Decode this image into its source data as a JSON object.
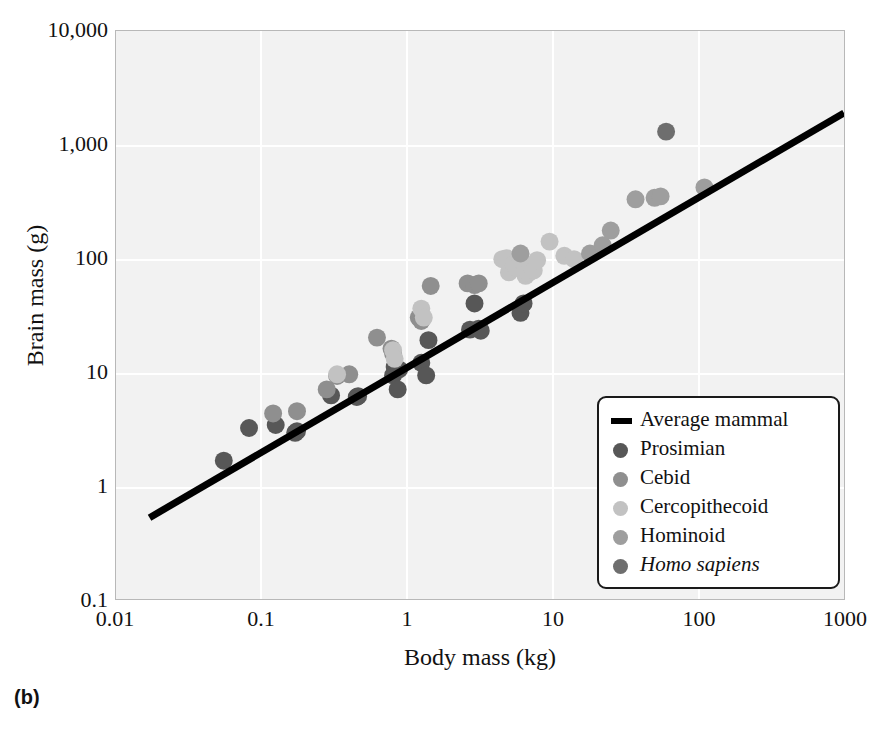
{
  "panel_caption": "(b)",
  "axes": {
    "x_title": "Body mass (kg)",
    "y_title": "Brain mass (g)",
    "x_ticks": [
      "0.01",
      "0.1",
      "1",
      "10",
      "100",
      "1000"
    ],
    "y_ticks": [
      "0.1",
      "1",
      "10",
      "100",
      "1,000",
      "10,000"
    ]
  },
  "legend": {
    "items": [
      {
        "label": "Average mammal",
        "marker": "line",
        "color": "#000000",
        "italic": false
      },
      {
        "label": "Prosimian",
        "marker": "dot",
        "color": "#575757",
        "italic": false
      },
      {
        "label": "Cebid",
        "marker": "dot",
        "color": "#8f8f8f",
        "italic": false
      },
      {
        "label": "Cercopithecoid",
        "marker": "dot",
        "color": "#c2c2c2",
        "italic": false
      },
      {
        "label": "Hominoid",
        "marker": "dot",
        "color": "#9e9e9e",
        "italic": false
      },
      {
        "label": "Homo sapiens",
        "marker": "dot",
        "color": "#6e6e6e",
        "italic": true
      }
    ]
  },
  "chart_data": {
    "type": "scatter",
    "title": "",
    "xlabel": "Body mass (kg)",
    "ylabel": "Brain mass (g)",
    "xscale": "log",
    "yscale": "log",
    "xlim": [
      0.01,
      1000
    ],
    "ylim": [
      0.1,
      10000
    ],
    "grid": true,
    "legend_position": "bottom-right",
    "marker_radius_px": 9,
    "colors": {
      "prosimian": "#575757",
      "cebid": "#8f8f8f",
      "cercopithecoid": "#c2c2c2",
      "hominoid": "#9e9e9e",
      "homo_sapiens": "#6e6e6e",
      "average_mammal_line": "#000000",
      "plot_background": "#f2f2f2",
      "gridline": "#ffffff",
      "page_background": "#ffffff"
    },
    "trendline": {
      "name": "Average mammal",
      "color": "#000000",
      "width_px": 7,
      "points": [
        {
          "x": 0.017,
          "y": 0.52
        },
        {
          "x": 1000,
          "y": 1900
        }
      ]
    },
    "series": [
      {
        "name": "Prosimian",
        "color": "#575757",
        "points": [
          {
            "x": 0.055,
            "y": 1.65
          },
          {
            "x": 0.082,
            "y": 3.2
          },
          {
            "x": 0.125,
            "y": 3.4
          },
          {
            "x": 0.17,
            "y": 2.9
          },
          {
            "x": 0.175,
            "y": 3.0
          },
          {
            "x": 0.3,
            "y": 6.2
          },
          {
            "x": 0.45,
            "y": 6.0
          },
          {
            "x": 0.46,
            "y": 6.1
          },
          {
            "x": 0.8,
            "y": 9.3
          },
          {
            "x": 0.82,
            "y": 11.0
          },
          {
            "x": 0.86,
            "y": 7.0
          },
          {
            "x": 0.88,
            "y": 10.5
          },
          {
            "x": 1.25,
            "y": 12.0
          },
          {
            "x": 1.35,
            "y": 9.3
          },
          {
            "x": 1.4,
            "y": 19.0
          },
          {
            "x": 2.7,
            "y": 23.5
          },
          {
            "x": 2.9,
            "y": 40.0
          },
          {
            "x": 3.1,
            "y": 24.0
          },
          {
            "x": 3.2,
            "y": 23.0
          },
          {
            "x": 6.0,
            "y": 33.0
          },
          {
            "x": 6.3,
            "y": 40.0
          }
        ]
      },
      {
        "name": "Cebid",
        "color": "#8f8f8f",
        "points": [
          {
            "x": 0.12,
            "y": 4.3
          },
          {
            "x": 0.175,
            "y": 4.5
          },
          {
            "x": 0.28,
            "y": 7.0
          },
          {
            "x": 0.33,
            "y": 9.2
          },
          {
            "x": 0.4,
            "y": 9.5
          },
          {
            "x": 0.62,
            "y": 20.0
          },
          {
            "x": 0.78,
            "y": 16.0
          },
          {
            "x": 0.8,
            "y": 14.5
          },
          {
            "x": 1.2,
            "y": 30.0
          },
          {
            "x": 1.25,
            "y": 28.0
          },
          {
            "x": 1.45,
            "y": 57.0
          },
          {
            "x": 2.6,
            "y": 60.0
          },
          {
            "x": 2.9,
            "y": 58.0
          },
          {
            "x": 3.1,
            "y": 60.0
          }
        ]
      },
      {
        "name": "Cercopithecoid",
        "color": "#c2c2c2",
        "points": [
          {
            "x": 0.33,
            "y": 9.5
          },
          {
            "x": 0.8,
            "y": 15.5
          },
          {
            "x": 0.82,
            "y": 13.0
          },
          {
            "x": 1.25,
            "y": 36.0
          },
          {
            "x": 1.3,
            "y": 30.0
          },
          {
            "x": 4.5,
            "y": 98.0
          },
          {
            "x": 4.8,
            "y": 100.0
          },
          {
            "x": 5.0,
            "y": 75.0
          },
          {
            "x": 5.4,
            "y": 88.0
          },
          {
            "x": 5.6,
            "y": 82.0
          },
          {
            "x": 6.0,
            "y": 96.0
          },
          {
            "x": 6.5,
            "y": 70.0
          },
          {
            "x": 6.8,
            "y": 74.0
          },
          {
            "x": 7.0,
            "y": 86.0
          },
          {
            "x": 7.4,
            "y": 78.0
          },
          {
            "x": 7.8,
            "y": 96.0
          },
          {
            "x": 9.5,
            "y": 140.0
          },
          {
            "x": 12.0,
            "y": 105.0
          },
          {
            "x": 14.0,
            "y": 98.0
          }
        ]
      },
      {
        "name": "Hominoid",
        "color": "#9e9e9e",
        "points": [
          {
            "x": 6.0,
            "y": 110.0
          },
          {
            "x": 18.0,
            "y": 110.0
          },
          {
            "x": 22.0,
            "y": 130.0
          },
          {
            "x": 25.0,
            "y": 175.0
          },
          {
            "x": 37.0,
            "y": 330.0
          },
          {
            "x": 50.0,
            "y": 340.0
          },
          {
            "x": 55.0,
            "y": 350.0
          },
          {
            "x": 110.0,
            "y": 420.0
          }
        ]
      },
      {
        "name": "Homo sapiens",
        "color": "#6e6e6e",
        "points": [
          {
            "x": 60.0,
            "y": 1300.0
          }
        ]
      }
    ]
  }
}
